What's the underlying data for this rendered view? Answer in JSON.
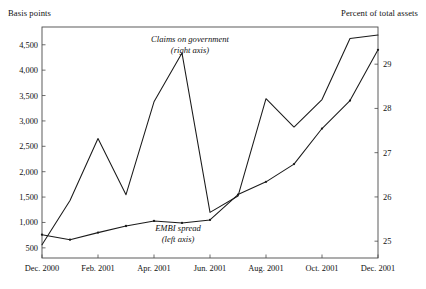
{
  "chart_data": {
    "type": "line",
    "title": "",
    "subtitle": "",
    "left_axis_title": "Basis points",
    "right_axis_title": "Percent of total assets",
    "xlabel": "",
    "grid": false,
    "legend_position": "inline-annotation",
    "x_tick_labels": [
      "Dec. 2000",
      "Feb. 2001",
      "Apr. 2001",
      "Jun. 2001",
      "Aug. 2001",
      "Oct. 2001",
      "Dec. 2001"
    ],
    "x_tick_months": [
      0,
      2,
      4,
      6,
      8,
      10,
      12
    ],
    "x_months": [
      0,
      1,
      2,
      3,
      4,
      5,
      6,
      7,
      8,
      9,
      10,
      11,
      12
    ],
    "left_ticks": [
      "500",
      "1,000",
      "1,500",
      "2,000",
      "2,500",
      "3,000",
      "3,500",
      "4,000",
      "4,500"
    ],
    "left_tick_values": [
      500,
      1000,
      1500,
      2000,
      2500,
      3000,
      3500,
      4000,
      4500
    ],
    "left_ylim": [
      300,
      4850
    ],
    "right_ticks": [
      "25",
      "26",
      "27",
      "28",
      "29"
    ],
    "right_tick_values": [
      25,
      26,
      27,
      28,
      29
    ],
    "right_ylim": [
      24.62,
      29.84
    ],
    "series": [
      {
        "name": "EMBI spread",
        "axis": "left",
        "annotation": "EMBI spread",
        "annotation_sub": "(left axis)",
        "markers": true,
        "values": [
          760,
          660,
          800,
          930,
          1030,
          990,
          1050,
          1550,
          1800,
          2150,
          2850,
          3400,
          4400
        ]
      },
      {
        "name": "Claims on government",
        "axis": "right",
        "annotation": "Claims on government",
        "annotation_sub": "(right axis)",
        "markers": false,
        "values": [
          24.92,
          25.92,
          27.32,
          26.05,
          28.15,
          29.25,
          25.65,
          26.02,
          28.22,
          27.58,
          28.2,
          29.58,
          29.66
        ]
      }
    ]
  }
}
